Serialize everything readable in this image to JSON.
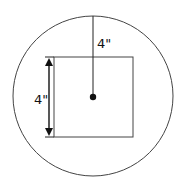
{
  "diagram": {
    "radius_label": "4\"",
    "side_label": "4\"",
    "stroke_color": "#444444",
    "accent_color": "#111111",
    "elements": [
      {
        "type": "circle",
        "name": "outer-circle"
      },
      {
        "type": "square",
        "name": "inner-square"
      },
      {
        "type": "radius-line",
        "name": "radius",
        "label": "4\""
      },
      {
        "type": "dimension-arrow",
        "name": "side-length",
        "label": "4\""
      },
      {
        "type": "point",
        "name": "center-point"
      }
    ]
  }
}
